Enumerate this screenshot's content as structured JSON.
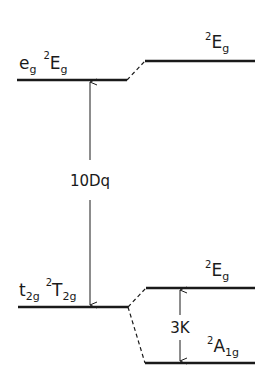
{
  "diagram": {
    "type": "energy-level-diagram",
    "colors": {
      "line": "#1a1a1a",
      "background": "#ffffff"
    },
    "levels": {
      "upper_left": {
        "orbital": "e",
        "orbital_sub": "g",
        "term_sup": "2",
        "term": "E",
        "term_sub": "g"
      },
      "upper_right": {
        "term_sup": "2",
        "term": "E",
        "term_sub": "g"
      },
      "lower_left": {
        "orbital": "t",
        "orbital_sub": "2g",
        "term_sup": "2",
        "term": "T",
        "term_sub": "2g"
      },
      "lower_right_upper": {
        "term_sup": "2",
        "term": "E",
        "term_sub": "g"
      },
      "lower_right_lower": {
        "term_sup": "2",
        "term": "A",
        "term_sub": "1g"
      }
    },
    "gaps": {
      "crystal_field": "10Dq",
      "splitting": "3K"
    }
  }
}
